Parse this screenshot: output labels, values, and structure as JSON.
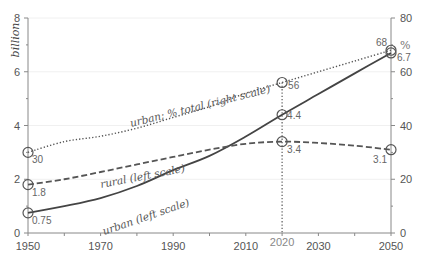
{
  "chart_data": {
    "type": "line",
    "title": "",
    "x": [
      1950,
      1960,
      1970,
      1980,
      1990,
      2000,
      2010,
      2020,
      2030,
      2040,
      2050
    ],
    "xlim": [
      1950,
      2050
    ],
    "x_ticks": [
      1950,
      1960,
      1970,
      1980,
      1990,
      2000,
      2010,
      2020,
      2030,
      2040,
      2050
    ],
    "x_tick_labels": [
      {
        "value": 1950,
        "label": "1950"
      },
      {
        "value": 1970,
        "label": "1970"
      },
      {
        "value": 1990,
        "label": "1990"
      },
      {
        "value": 2010,
        "label": "2010"
      },
      {
        "value": 2020,
        "label": "2020",
        "highlight": true
      },
      {
        "value": 2030,
        "label": "2030"
      },
      {
        "value": 2050,
        "label": "2050"
      }
    ],
    "left_axis": {
      "label": "billion",
      "ylim": [
        0,
        8
      ],
      "ticks": [
        0,
        2,
        4,
        6,
        8
      ],
      "minor_ticks": [
        1,
        3,
        5,
        7
      ]
    },
    "right_axis": {
      "label": "%",
      "ylim": [
        0,
        80
      ],
      "ticks": [
        0,
        20,
        40,
        60,
        80
      ],
      "minor_ticks": [
        10,
        30,
        50,
        70
      ]
    },
    "grid": true,
    "series": [
      {
        "name": "urban (left scale)",
        "axis": "left",
        "style": "solid",
        "values": [
          0.75,
          1.0,
          1.3,
          1.75,
          2.34,
          2.87,
          3.59,
          4.4,
          5.17,
          5.94,
          6.7
        ]
      },
      {
        "name": "rural (left scale)",
        "axis": "left",
        "style": "dashed",
        "values": [
          1.8,
          2.0,
          2.27,
          2.55,
          2.83,
          3.1,
          3.32,
          3.4,
          3.35,
          3.25,
          3.1
        ]
      },
      {
        "name": "urban; % total (right scale)",
        "axis": "right",
        "style": "dotted",
        "values": [
          30,
          34,
          36,
          39,
          43,
          47,
          52,
          56,
          60,
          64,
          68
        ]
      }
    ],
    "annotations": [
      {
        "series": 0,
        "x": 1950,
        "value": 0.75,
        "label": "0.75"
      },
      {
        "series": 0,
        "x": 2020,
        "value": 4.4,
        "label": "4.4"
      },
      {
        "series": 0,
        "x": 2050,
        "value": 6.7,
        "label": "6.7"
      },
      {
        "series": 1,
        "x": 1950,
        "value": 1.8,
        "label": "1.8"
      },
      {
        "series": 1,
        "x": 2020,
        "value": 3.4,
        "label": "3.4"
      },
      {
        "series": 1,
        "x": 2050,
        "value": 3.1,
        "label": "3.1"
      },
      {
        "series": 2,
        "x": 1950,
        "value": 30,
        "label": "30"
      },
      {
        "series": 2,
        "x": 2020,
        "value": 56,
        "label": "56"
      },
      {
        "series": 2,
        "x": 2050,
        "value": 68,
        "label": "68"
      }
    ],
    "reference_line": {
      "x": 2020,
      "style": "dotted"
    }
  }
}
